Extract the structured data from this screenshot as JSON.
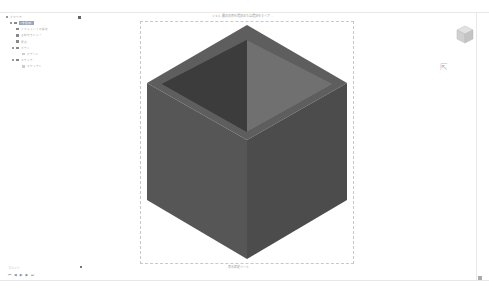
{
  "tree": {
    "header": "ブラウザ",
    "items": [
      {
        "label": "(未保存)",
        "level": 0,
        "selected": true
      },
      {
        "label": "ドキュメントの設定",
        "level": 1
      },
      {
        "label": "名前付きビュー",
        "level": 1
      },
      {
        "label": "原点",
        "level": 1
      },
      {
        "label": "ボディ",
        "level": 1
      },
      {
        "label": "ボディ1",
        "level": 2
      },
      {
        "label": "スケッチ",
        "level": 1
      },
      {
        "label": "スケッチ1",
        "level": 2
      }
    ]
  },
  "viewport": {
    "title": "シェル 最初の面を選択または選択をクリア ...",
    "bottom_toolbar": "表示設定ツール"
  },
  "bottom": {
    "comments_label": "コメント",
    "timeline": [
      "⏮",
      "◀",
      "▶",
      "▶",
      "⏭"
    ]
  },
  "colors": {
    "body": "#5a5a5a",
    "inner_left": "#3e3e3e",
    "inner_right": "#6b6b6b"
  }
}
